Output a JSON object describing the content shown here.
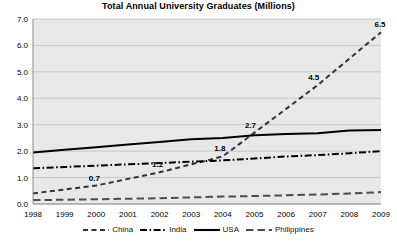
{
  "chart_data": {
    "type": "line",
    "title": "Total Annual University Graduates (Millions)",
    "xlabel": "",
    "ylabel": "",
    "x": [
      1998,
      1999,
      2000,
      2001,
      2002,
      2003,
      2004,
      2005,
      2006,
      2007,
      2008,
      2009
    ],
    "categories": [
      "1998",
      "1999",
      "2000",
      "2001",
      "2002",
      "2003",
      "2004",
      "2005",
      "2006",
      "2007",
      "2008",
      "2009"
    ],
    "ylim": [
      0.0,
      7.0
    ],
    "yticks": [
      "0.0",
      "1.0",
      "2.0",
      "3.0",
      "4.0",
      "5.0",
      "6.0",
      "7.0"
    ],
    "ytick_values": [
      0.0,
      1.0,
      2.0,
      3.0,
      4.0,
      5.0,
      6.0,
      7.0
    ],
    "grid": true,
    "legend_position": "bottom",
    "plot_background": "#e8e8e8",
    "series": [
      {
        "name": "China",
        "style": "dashed",
        "color": "#333333",
        "values": [
          0.4,
          0.55,
          0.7,
          0.95,
          1.2,
          1.5,
          1.8,
          2.7,
          3.6,
          4.5,
          5.5,
          6.5
        ]
      },
      {
        "name": "India",
        "style": "dash-dot",
        "color": "#000000",
        "values": [
          1.35,
          1.4,
          1.45,
          1.5,
          1.55,
          1.6,
          1.65,
          1.72,
          1.8,
          1.85,
          1.92,
          2.0
        ]
      },
      {
        "name": "USA",
        "style": "solid",
        "color": "#000000",
        "values": [
          1.95,
          2.05,
          2.15,
          2.25,
          2.35,
          2.45,
          2.5,
          2.6,
          2.65,
          2.68,
          2.78,
          2.8
        ]
      },
      {
        "name": "Philippines",
        "style": "long-dash",
        "color": "#4d4d4d",
        "values": [
          0.15,
          0.16,
          0.18,
          0.2,
          0.22,
          0.25,
          0.28,
          0.3,
          0.33,
          0.36,
          0.4,
          0.45
        ]
      }
    ],
    "annotations": [
      {
        "text": "0.7",
        "series": "China",
        "x": 2000,
        "y": 0.7
      },
      {
        "text": "1.2",
        "series": "China",
        "x": 2002,
        "y": 1.2
      },
      {
        "text": "1.8",
        "series": "China",
        "x": 2004,
        "y": 1.8
      },
      {
        "text": "2.7",
        "series": "China",
        "x": 2005,
        "y": 2.7
      },
      {
        "text": "4.5",
        "series": "China",
        "x": 2007,
        "y": 4.5
      },
      {
        "text": "6.5",
        "series": "China",
        "x": 2009,
        "y": 6.5
      }
    ]
  },
  "legend": {
    "items": [
      {
        "label": "China"
      },
      {
        "label": "India"
      },
      {
        "label": "USA"
      },
      {
        "label": "Philippines"
      }
    ]
  }
}
